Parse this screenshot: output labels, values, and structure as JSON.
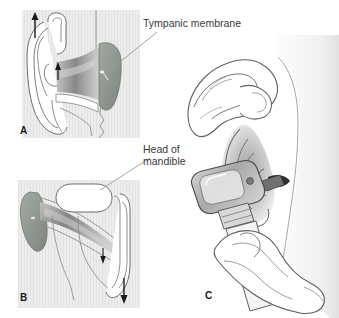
{
  "figure": {
    "title_alt": "Otoscopic examination of the ear: canal straightening and otoscope placement",
    "background_color": "#ffffff",
    "ink_color": "#4a4a4a",
    "text_color": "#3a3a3a",
    "panel_bg_color": "#ebebeb",
    "membrane_color": "#8e948e",
    "canal_shadow_color": "#6f6f6f"
  },
  "labels": {
    "tympanic_membrane": "Tympanic membrane",
    "head_of_mandible_line1": "Head of",
    "head_of_mandible_line2": "mandible"
  },
  "panels": [
    {
      "id": "A",
      "letter": "A",
      "caption_alt": "Sagittal section of external ear showing auricle pulled upward and backward to straighten the cartilaginous ear canal; tympanic membrane at canal end",
      "arrows": [
        {
          "name": "auricle-traction-arrow",
          "direction": "up"
        },
        {
          "name": "canal-direction-arrow",
          "direction": "up"
        }
      ]
    },
    {
      "id": "B",
      "letter": "B",
      "caption_alt": "Section showing ear canal with head of mandible anterior to canal; auricle traction directed downward",
      "arrows": [
        {
          "name": "canal-direction-arrow",
          "direction": "down"
        },
        {
          "name": "auricle-traction-arrow",
          "direction": "down"
        }
      ]
    },
    {
      "id": "C",
      "letter": "C",
      "caption_alt": "Clinician's hand pulling the auricle upward and backward while the other hand introduces the otoscope speculum into the external auditory canal"
    }
  ]
}
